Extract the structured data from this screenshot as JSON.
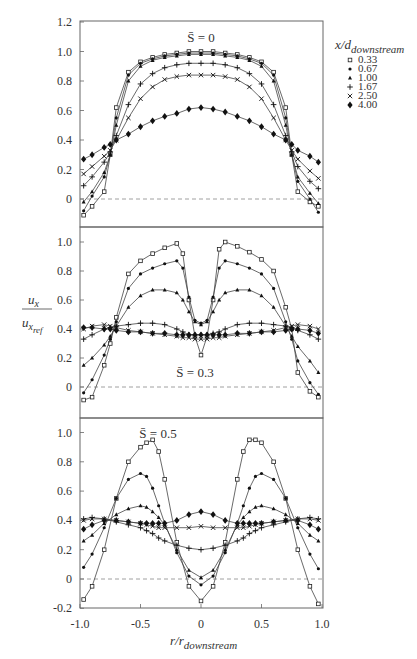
{
  "chart_data": {
    "type": "line",
    "figure": {
      "ylabel": "u_x / u_x_ref",
      "xlabel": "r/r_downstream",
      "x_ticks": [
        "-1.0",
        "-0.5",
        "0",
        "0.5",
        "1.0"
      ],
      "xlim": [
        -1.0,
        1.0
      ]
    },
    "legend": {
      "title": "x/d_downstream",
      "entries": [
        {
          "label": "0.33",
          "marker": "open-square"
        },
        {
          "label": "0.67",
          "marker": "small-dot"
        },
        {
          "label": "1.00",
          "marker": "triangle"
        },
        {
          "label": "1.67",
          "marker": "plus"
        },
        {
          "label": "2.50",
          "marker": "cross"
        },
        {
          "label": "4.00",
          "marker": "filled-diamond"
        }
      ]
    },
    "panels": [
      {
        "annotation": "S̄ = 0",
        "ylim": [
          -0.12,
          1.2
        ],
        "y_ticks": [
          "1.2",
          "1.0",
          "0.8",
          "0.6",
          "0.4",
          "0.2",
          "0"
        ],
        "x": [
          -0.97,
          -0.9,
          -0.8,
          -0.75,
          -0.7,
          -0.6,
          -0.5,
          -0.4,
          -0.3,
          -0.2,
          -0.1,
          0,
          0.1,
          0.2,
          0.3,
          0.4,
          0.5,
          0.6,
          0.7,
          0.75,
          0.8,
          0.9,
          0.97
        ],
        "series": [
          {
            "name": "0.33",
            "values": [
              -0.11,
              -0.05,
              0.05,
              0.3,
              0.62,
              0.86,
              0.93,
              0.96,
              0.98,
              0.99,
              1.0,
              1.0,
              1.0,
              0.99,
              0.98,
              0.96,
              0.93,
              0.86,
              0.62,
              0.3,
              0.05,
              -0.02,
              -0.05
            ]
          },
          {
            "name": "0.67",
            "values": [
              -0.08,
              0.02,
              0.15,
              0.3,
              0.55,
              0.84,
              0.92,
              0.95,
              0.97,
              0.98,
              0.99,
              0.99,
              0.99,
              0.98,
              0.97,
              0.95,
              0.92,
              0.84,
              0.55,
              0.3,
              0.12,
              0.0,
              -0.09
            ]
          },
          {
            "name": "1.00",
            "values": [
              -0.02,
              0.05,
              0.18,
              0.3,
              0.5,
              0.8,
              0.9,
              0.94,
              0.96,
              0.97,
              0.98,
              0.98,
              0.98,
              0.97,
              0.96,
              0.94,
              0.9,
              0.8,
              0.5,
              0.3,
              0.15,
              0.04,
              -0.03
            ]
          },
          {
            "name": "1.67",
            "values": [
              0.09,
              0.15,
              0.25,
              0.32,
              0.43,
              0.64,
              0.78,
              0.85,
              0.89,
              0.91,
              0.92,
              0.92,
              0.92,
              0.91,
              0.89,
              0.85,
              0.78,
              0.64,
              0.43,
              0.32,
              0.22,
              0.12,
              0.07
            ]
          },
          {
            "name": "2.50",
            "values": [
              0.17,
              0.22,
              0.29,
              0.33,
              0.4,
              0.55,
              0.68,
              0.76,
              0.81,
              0.83,
              0.84,
              0.84,
              0.84,
              0.83,
              0.81,
              0.76,
              0.68,
              0.55,
              0.4,
              0.33,
              0.27,
              0.19,
              0.14
            ]
          },
          {
            "name": "4.00",
            "values": [
              0.27,
              0.3,
              0.35,
              0.37,
              0.4,
              0.44,
              0.49,
              0.53,
              0.56,
              0.58,
              0.61,
              0.62,
              0.61,
              0.59,
              0.56,
              0.53,
              0.49,
              0.44,
              0.4,
              0.37,
              0.33,
              0.29,
              0.25
            ]
          }
        ]
      },
      {
        "annotation": "S̄ = 0.3",
        "ylim": [
          -0.1,
          1.1
        ],
        "y_ticks": [
          "1.0",
          "0.8",
          "0.6",
          "0.4",
          "0.2",
          "0"
        ],
        "x": [
          -0.97,
          -0.9,
          -0.8,
          -0.75,
          -0.7,
          -0.6,
          -0.5,
          -0.4,
          -0.3,
          -0.2,
          -0.15,
          -0.1,
          -0.05,
          0,
          0.05,
          0.1,
          0.15,
          0.2,
          0.3,
          0.4,
          0.5,
          0.6,
          0.7,
          0.75,
          0.8,
          0.9,
          0.97
        ],
        "series": [
          {
            "name": "0.33",
            "values": [
              -0.09,
              -0.07,
              0.15,
              0.3,
              0.48,
              0.78,
              0.87,
              0.92,
              0.96,
              0.99,
              0.92,
              0.6,
              0.35,
              0.22,
              0.35,
              0.6,
              0.95,
              1.0,
              0.97,
              0.93,
              0.88,
              0.8,
              0.55,
              0.4,
              0.1,
              -0.03,
              -0.07
            ]
          },
          {
            "name": "0.67",
            "values": [
              -0.04,
              0.05,
              0.22,
              0.33,
              0.45,
              0.68,
              0.78,
              0.82,
              0.85,
              0.87,
              0.82,
              0.62,
              0.46,
              0.44,
              0.46,
              0.62,
              0.82,
              0.87,
              0.85,
              0.82,
              0.78,
              0.68,
              0.45,
              0.33,
              0.18,
              0.03,
              -0.05
            ]
          },
          {
            "name": "1.00",
            "values": [
              0.15,
              0.2,
              0.29,
              0.35,
              0.42,
              0.55,
              0.63,
              0.67,
              0.67,
              0.65,
              0.6,
              0.52,
              0.45,
              0.43,
              0.45,
              0.52,
              0.6,
              0.65,
              0.67,
              0.67,
              0.63,
              0.55,
              0.42,
              0.35,
              0.28,
              0.18,
              0.1
            ]
          },
          {
            "name": "1.67",
            "values": [
              0.33,
              0.36,
              0.4,
              0.41,
              0.42,
              0.43,
              0.44,
              0.44,
              0.43,
              0.4,
              0.38,
              0.36,
              0.36,
              0.36,
              0.36,
              0.37,
              0.38,
              0.4,
              0.43,
              0.44,
              0.44,
              0.43,
              0.42,
              0.41,
              0.39,
              0.36,
              0.33
            ]
          },
          {
            "name": "2.50",
            "values": [
              0.4,
              0.42,
              0.43,
              0.42,
              0.41,
              0.39,
              0.38,
              0.37,
              0.36,
              0.35,
              0.34,
              0.34,
              0.33,
              0.33,
              0.33,
              0.34,
              0.34,
              0.35,
              0.36,
              0.37,
              0.38,
              0.39,
              0.41,
              0.42,
              0.43,
              0.42,
              0.4
            ]
          },
          {
            "name": "4.00",
            "values": [
              0.41,
              0.41,
              0.4,
              0.4,
              0.39,
              0.38,
              0.38,
              0.37,
              0.37,
              0.36,
              0.36,
              0.36,
              0.36,
              0.36,
              0.36,
              0.36,
              0.36,
              0.36,
              0.37,
              0.37,
              0.38,
              0.38,
              0.39,
              0.4,
              0.4,
              0.39,
              0.37
            ]
          }
        ]
      },
      {
        "annotation": "S̄ = 0.5",
        "ylim": [
          -0.2,
          1.05
        ],
        "y_ticks": [
          "1.0",
          "0.8",
          "0.6",
          "0.4",
          "0.2",
          "0",
          "-0.2"
        ],
        "x": [
          -0.97,
          -0.9,
          -0.8,
          -0.7,
          -0.6,
          -0.5,
          -0.45,
          -0.4,
          -0.35,
          -0.3,
          -0.2,
          -0.1,
          0,
          0.1,
          0.2,
          0.3,
          0.35,
          0.4,
          0.45,
          0.5,
          0.6,
          0.7,
          0.8,
          0.9,
          0.97
        ],
        "series": [
          {
            "name": "0.33",
            "values": [
              -0.14,
              -0.05,
              0.2,
              0.55,
              0.8,
              0.9,
              0.93,
              0.95,
              0.87,
              0.68,
              0.25,
              -0.05,
              -0.15,
              -0.05,
              0.25,
              0.68,
              0.87,
              0.95,
              0.95,
              0.93,
              0.8,
              0.55,
              0.2,
              -0.05,
              -0.17
            ]
          },
          {
            "name": "0.67",
            "values": [
              0.08,
              0.17,
              0.35,
              0.55,
              0.68,
              0.72,
              0.7,
              0.62,
              0.5,
              0.38,
              0.18,
              0.02,
              -0.04,
              0.02,
              0.18,
              0.38,
              0.5,
              0.62,
              0.7,
              0.72,
              0.68,
              0.55,
              0.35,
              0.17,
              0.07
            ]
          },
          {
            "name": "1.00",
            "values": [
              0.26,
              0.3,
              0.38,
              0.44,
              0.48,
              0.5,
              0.49,
              0.46,
              0.42,
              0.37,
              0.2,
              0.06,
              0.01,
              0.06,
              0.2,
              0.37,
              0.42,
              0.46,
              0.49,
              0.5,
              0.48,
              0.44,
              0.38,
              0.3,
              0.26
            ]
          },
          {
            "name": "1.67",
            "values": [
              0.41,
              0.42,
              0.41,
              0.39,
              0.37,
              0.35,
              0.33,
              0.31,
              0.28,
              0.26,
              0.23,
              0.21,
              0.2,
              0.21,
              0.23,
              0.26,
              0.28,
              0.31,
              0.33,
              0.35,
              0.37,
              0.39,
              0.41,
              0.42,
              0.41
            ]
          },
          {
            "name": "2.50",
            "values": [
              0.4,
              0.41,
              0.41,
              0.4,
              0.39,
              0.38,
              0.37,
              0.36,
              0.35,
              0.35,
              0.35,
              0.35,
              0.36,
              0.35,
              0.35,
              0.35,
              0.35,
              0.36,
              0.37,
              0.38,
              0.39,
              0.4,
              0.41,
              0.41,
              0.4
            ]
          },
          {
            "name": "4.00",
            "values": [
              0.34,
              0.37,
              0.4,
              0.4,
              0.39,
              0.38,
              0.38,
              0.38,
              0.38,
              0.38,
              0.4,
              0.44,
              0.46,
              0.44,
              0.4,
              0.38,
              0.38,
              0.38,
              0.38,
              0.38,
              0.39,
              0.4,
              0.4,
              0.37,
              0.34
            ]
          }
        ]
      }
    ]
  },
  "labels": {
    "ylabel_num": "u",
    "ylabel_num_sub": "x",
    "ylabel_den": "u",
    "ylabel_den_sub": "x",
    "ylabel_den_subsub": "ref",
    "xlabel_main": "r/r",
    "xlabel_sub": "downstream",
    "legend_title_main": "x/d",
    "legend_title_sub": "downstream"
  }
}
